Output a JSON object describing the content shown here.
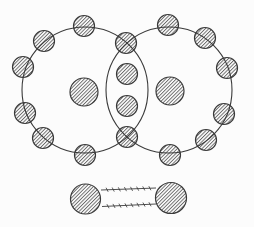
{
  "diagram": {
    "canvas": {
      "width": 254,
      "height": 227,
      "background": "#fcfcfc"
    },
    "colors": {
      "outline": "#3a3a3a",
      "hatch_line": "#5f5f5f",
      "circle_fill": "#ffffff"
    },
    "hatch": {
      "spacing": 2.5,
      "line_width": 0.9,
      "angle_deg": 45
    },
    "shells": [
      {
        "cx": 85,
        "cy": 90,
        "r": 63
      },
      {
        "cx": 169,
        "cy": 90,
        "r": 63
      }
    ],
    "shell_stroke_width": 1.1,
    "nuclei": [
      {
        "cx": 84,
        "cy": 92,
        "r": 14
      },
      {
        "cx": 170,
        "cy": 91,
        "r": 14
      }
    ],
    "electron_radius": 10.5,
    "electron_stroke_width": 1.2,
    "electrons": {
      "left_shell": [
        [
          84,
          26
        ],
        [
          44,
          41
        ],
        [
          23,
          67
        ],
        [
          25,
          113
        ],
        [
          43,
          138
        ],
        [
          85,
          155
        ]
      ],
      "shared_intersection": [
        [
          126,
          43
        ],
        [
          127,
          137
        ]
      ],
      "shared_overlap": [
        [
          127,
          74
        ],
        [
          127,
          106
        ]
      ],
      "right_shell": [
        [
          168,
          25
        ],
        [
          205,
          38
        ],
        [
          227,
          68
        ],
        [
          224,
          114
        ],
        [
          206,
          140
        ],
        [
          170,
          155
        ]
      ]
    },
    "bond_model": {
      "atoms": [
        {
          "cx": 85.5,
          "cy": 199,
          "r": 15
        },
        {
          "cx": 171,
          "cy": 198,
          "r": 15.5
        }
      ],
      "links": [
        {
          "x1": 101,
          "y1": 190,
          "x2": 156,
          "y2": 188,
          "ticks": 8
        },
        {
          "x1": 102,
          "y1": 206.5,
          "x2": 156,
          "y2": 204,
          "ticks": 8
        }
      ],
      "link_stroke_width": 0.9,
      "tick_length": 4.6,
      "tick_angle_deg": 65,
      "tick_stroke_width": 0.8
    }
  }
}
